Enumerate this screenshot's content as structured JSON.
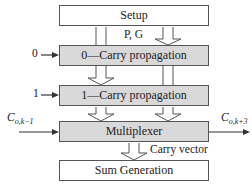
{
  "diagram": {
    "blocks": [
      {
        "id": "setup",
        "label": "Setup",
        "fill": "#ffffff"
      },
      {
        "id": "carry0",
        "label": "0—Carry propagation",
        "fill": "#d9d9d9"
      },
      {
        "id": "carry1",
        "label": "1—Carry propagation",
        "fill": "#d9d9d9"
      },
      {
        "id": "mux",
        "label": "Multiplexer",
        "fill": "#d9d9d9"
      },
      {
        "id": "sum",
        "label": "Sum Generation",
        "fill": "#ffffff"
      }
    ],
    "labels": {
      "pg": "P, G",
      "carry_vector": "Carry vector",
      "input0": "0",
      "input1": "1",
      "carry_in_main": "C",
      "carry_in_sub": "o,k−1",
      "carry_out_main": "C",
      "carry_out_sub": "o,k+3"
    }
  }
}
